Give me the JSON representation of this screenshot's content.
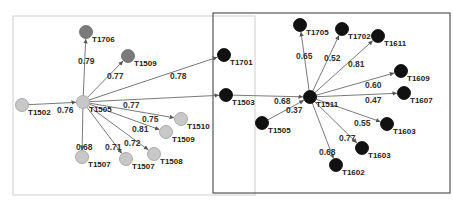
{
  "diagram": {
    "type": "network-graph",
    "colors": {
      "light_node": "#c8c8c8",
      "gray_node": "#7a7a7a",
      "dark_node": "#111111",
      "edge": "#6b6b6b",
      "left_frame": "#cfcfcf",
      "right_frame": "#555555"
    },
    "frames": [
      {
        "id": "left-cluster-frame",
        "x": 13,
        "y": 16,
        "w": 242,
        "h": 179
      },
      {
        "id": "right-cluster-frame",
        "x": 213,
        "y": 13,
        "w": 237,
        "h": 180
      }
    ],
    "nodes": [
      {
        "id": "L_T1505",
        "label": "T1505",
        "x": 83,
        "y": 102,
        "style": "light"
      },
      {
        "id": "L_T1706",
        "label": "T1706",
        "x": 86,
        "y": 32,
        "style": "gray"
      },
      {
        "id": "L_T1509top",
        "label": "T1509",
        "x": 128,
        "y": 56,
        "style": "gray"
      },
      {
        "id": "L_T1502",
        "label": "T1502",
        "x": 22,
        "y": 105,
        "style": "light"
      },
      {
        "id": "L_T1510",
        "label": "T1510",
        "x": 181,
        "y": 119,
        "style": "light"
      },
      {
        "id": "L_T1509",
        "label": "T1509",
        "x": 166,
        "y": 132,
        "style": "light"
      },
      {
        "id": "L_T1507a",
        "label": "T1507",
        "x": 82,
        "y": 157,
        "style": "light"
      },
      {
        "id": "L_T1507b",
        "label": "T1507",
        "x": 126,
        "y": 159,
        "style": "light"
      },
      {
        "id": "L_T1508",
        "label": "T1508",
        "x": 154,
        "y": 154,
        "style": "light"
      },
      {
        "id": "R_T1701",
        "label": "T1701",
        "x": 224,
        "y": 55,
        "style": "dark"
      },
      {
        "id": "R_T1503",
        "label": "T1503",
        "x": 226,
        "y": 95,
        "style": "dark"
      },
      {
        "id": "R_T1511",
        "label": "T1511",
        "x": 310,
        "y": 97,
        "style": "dark"
      },
      {
        "id": "R_T1705",
        "label": "T1705",
        "x": 300,
        "y": 25,
        "style": "dark"
      },
      {
        "id": "R_T1702",
        "label": "T1702",
        "x": 342,
        "y": 29,
        "style": "dark"
      },
      {
        "id": "R_T1611",
        "label": "T1611",
        "x": 378,
        "y": 36,
        "style": "dark"
      },
      {
        "id": "R_T1609",
        "label": "T1609",
        "x": 401,
        "y": 71,
        "style": "dark"
      },
      {
        "id": "R_T1607",
        "label": "T1607",
        "x": 404,
        "y": 93,
        "style": "dark"
      },
      {
        "id": "R_T1505",
        "label": "T1505",
        "x": 262,
        "y": 123,
        "style": "dark"
      },
      {
        "id": "R_T1603a",
        "label": "T1603",
        "x": 387,
        "y": 124,
        "style": "dark"
      },
      {
        "id": "R_T1603b",
        "label": "T1603",
        "x": 362,
        "y": 148,
        "style": "dark"
      },
      {
        "id": "R_T1602",
        "label": "T1602",
        "x": 336,
        "y": 165,
        "style": "dark"
      }
    ],
    "edges": [
      {
        "from": "L_T1505",
        "to": "L_T1706",
        "weight": "0.79",
        "lx": 78,
        "ly": 64
      },
      {
        "from": "L_T1505",
        "to": "L_T1509top",
        "weight": "0.77",
        "lx": 107,
        "ly": 79
      },
      {
        "from": "L_T1505",
        "to": "R_T1701",
        "weight": "0.78",
        "lx": 170,
        "ly": 79
      },
      {
        "from": "L_T1502",
        "to": "L_T1505",
        "weight": "0.76",
        "lx": 57,
        "ly": 113
      },
      {
        "from": "L_T1505",
        "to": "R_T1503",
        "weight": "0.77",
        "lx": 123,
        "ly": 108
      },
      {
        "from": "L_T1505",
        "to": "L_T1510",
        "weight": "0.75",
        "lx": 142,
        "ly": 122
      },
      {
        "from": "L_T1505",
        "to": "L_T1509",
        "weight": "0.81",
        "lx": 132,
        "ly": 132
      },
      {
        "from": "L_T1505",
        "to": "L_T1507a",
        "weight": "0.68",
        "lx": 76,
        "ly": 150
      },
      {
        "from": "L_T1505",
        "to": "L_T1507b",
        "weight": "0.71",
        "lx": 105,
        "ly": 150
      },
      {
        "from": "L_T1505",
        "to": "L_T1508",
        "weight": "0.72",
        "lx": 124,
        "ly": 146
      },
      {
        "from": "R_T1503",
        "to": "R_T1511",
        "weight": "0.68",
        "lx": 274,
        "ly": 104
      },
      {
        "from": "R_T1505",
        "to": "R_T1511",
        "weight": "0.37",
        "lx": 286,
        "ly": 113
      },
      {
        "from": "R_T1511",
        "to": "R_T1705",
        "weight": "0.65",
        "lx": 296,
        "ly": 59
      },
      {
        "from": "R_T1511",
        "to": "R_T1702",
        "weight": "0.52",
        "lx": 324,
        "ly": 61
      },
      {
        "from": "R_T1511",
        "to": "R_T1611",
        "weight": "0.81",
        "lx": 348,
        "ly": 67
      },
      {
        "from": "R_T1511",
        "to": "R_T1609",
        "weight": "0.60",
        "lx": 365,
        "ly": 88
      },
      {
        "from": "R_T1511",
        "to": "R_T1607",
        "weight": "0.47",
        "lx": 365,
        "ly": 103
      },
      {
        "from": "R_T1511",
        "to": "R_T1603a",
        "weight": "0.55",
        "lx": 354,
        "ly": 126
      },
      {
        "from": "R_T1511",
        "to": "R_T1603b",
        "weight": "0.77",
        "lx": 339,
        "ly": 141
      },
      {
        "from": "R_T1511",
        "to": "R_T1602",
        "weight": "0.68",
        "lx": 319,
        "ly": 155
      }
    ]
  }
}
